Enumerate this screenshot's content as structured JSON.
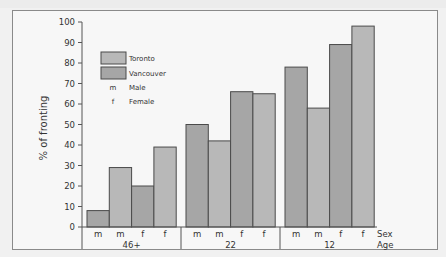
{
  "chart_data": {
    "type": "bar",
    "title": "",
    "xlabel": "Age",
    "ylabel": "% of fronting",
    "ylim": [
      0,
      100
    ],
    "yticks": [
      0,
      10,
      20,
      30,
      40,
      50,
      60,
      70,
      80,
      90,
      100
    ],
    "grid": false,
    "legend_position": "upper-left inside",
    "legend": [
      {
        "key": "swatch",
        "label": "Toronto",
        "color": "#b8b8b8"
      },
      {
        "key": "swatch",
        "label": "Vancouver",
        "color": "#a6a6a6"
      },
      {
        "key": "m",
        "label": "Male"
      },
      {
        "key": "f",
        "label": "Female"
      }
    ],
    "row_labels": {
      "sex": "Sex",
      "age": "Age"
    },
    "groups": [
      {
        "age": "46+",
        "bars": [
          {
            "sex": "m",
            "city": "Vancouver",
            "value": 8
          },
          {
            "sex": "m",
            "city": "Toronto",
            "value": 29
          },
          {
            "sex": "f",
            "city": "Vancouver",
            "value": 20
          },
          {
            "sex": "f",
            "city": "Toronto",
            "value": 39
          }
        ]
      },
      {
        "age": "22",
        "bars": [
          {
            "sex": "m",
            "city": "Vancouver",
            "value": 50
          },
          {
            "sex": "m",
            "city": "Toronto",
            "value": 42
          },
          {
            "sex": "f",
            "city": "Vancouver",
            "value": 66
          },
          {
            "sex": "f",
            "city": "Toronto",
            "value": 65
          }
        ]
      },
      {
        "age": "12",
        "bars": [
          {
            "sex": "m",
            "city": "Vancouver",
            "value": 78
          },
          {
            "sex": "m",
            "city": "Toronto",
            "value": 58
          },
          {
            "sex": "f",
            "city": "Vancouver",
            "value": 89
          },
          {
            "sex": "f",
            "city": "Toronto",
            "value": 98
          }
        ]
      }
    ],
    "colors": {
      "Toronto": "#b8b8b8",
      "Vancouver": "#a6a6a6",
      "outline": "#4a4a4a"
    }
  }
}
